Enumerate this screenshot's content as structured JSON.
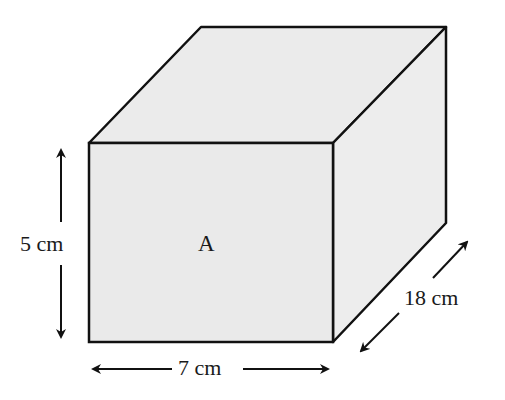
{
  "diagram": {
    "shape": "rectangular prism",
    "face_label": "A",
    "dimensions": {
      "height": "5 cm",
      "width": "7 cm",
      "depth": "18 cm"
    },
    "colors": {
      "face_fill": "#ececec",
      "edge": "#111111"
    }
  }
}
